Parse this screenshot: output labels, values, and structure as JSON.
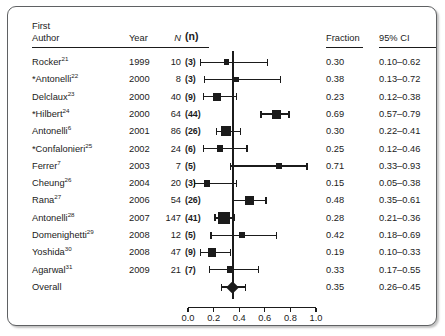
{
  "figure": {
    "type": "forest-plot",
    "headers": {
      "author_line1": "First",
      "author_line2": "Author",
      "year": "Year",
      "N": "N",
      "n": "(n)",
      "fraction": "Fraction",
      "ci": "95% CI"
    },
    "overall_label": "Overall"
  },
  "chart_data": {
    "type": "scatter",
    "title": "",
    "xlabel": "",
    "ylabel": "",
    "xlim": [
      0.0,
      1.0
    ],
    "xticks": [
      "0.0",
      "0.2",
      "0.4",
      "0.6",
      "0.8",
      "1.0"
    ],
    "xtick_values": [
      0.0,
      0.2,
      0.4,
      0.6,
      0.8,
      1.0
    ],
    "grid": false,
    "legend": "none",
    "reference_line": 0.35,
    "categories": [
      "Rocker 1999",
      "*Antonelli 2000",
      "Delclaux 2000",
      "*Hilbert 2000",
      "Antonelli 2001",
      "*Confalonieri 2002",
      "Ferrer 2003",
      "Cheung 2004",
      "Rana 2006",
      "Antonelli 2007",
      "Domenighetti 2008",
      "Yoshida 2008",
      "Agarwal 2009",
      "Overall"
    ],
    "values": [
      0.3,
      0.38,
      0.23,
      0.69,
      0.3,
      0.25,
      0.71,
      0.15,
      0.48,
      0.28,
      0.42,
      0.19,
      0.33,
      0.35
    ],
    "ci_low": [
      0.1,
      0.13,
      0.12,
      0.57,
      0.22,
      0.12,
      0.33,
      0.05,
      0.35,
      0.21,
      0.18,
      0.1,
      0.17,
      0.26
    ],
    "ci_high": [
      0.62,
      0.72,
      0.38,
      0.79,
      0.41,
      0.46,
      0.93,
      0.38,
      0.61,
      0.36,
      0.69,
      0.33,
      0.55,
      0.45
    ]
  },
  "rows": [
    {
      "author": "Rocker",
      "ref": "21",
      "star": "",
      "year": "1999",
      "N": "10",
      "n": "(3)",
      "fraction": "0.30",
      "ci": "0.10–0.62",
      "est": 0.3,
      "low": 0.1,
      "high": 0.62,
      "weight": 10
    },
    {
      "author": "Antonelli",
      "ref": "22",
      "star": "*",
      "year": "2000",
      "N": "8",
      "n": "(3)",
      "fraction": "0.38",
      "ci": "0.13–0.72",
      "est": 0.38,
      "low": 0.13,
      "high": 0.72,
      "weight": 8
    },
    {
      "author": "Delclaux",
      "ref": "23",
      "star": "",
      "year": "2000",
      "N": "40",
      "n": "(9)",
      "fraction": "0.23",
      "ci": "0.12–0.38",
      "est": 0.23,
      "low": 0.12,
      "high": 0.38,
      "weight": 40
    },
    {
      "author": "Hilbert",
      "ref": "24",
      "star": "*",
      "year": "2000",
      "N": "64",
      "n": "(44)",
      "fraction": "0.69",
      "ci": "0.57–0.79",
      "est": 0.69,
      "low": 0.57,
      "high": 0.79,
      "weight": 64
    },
    {
      "author": "Antonelli",
      "ref": "6",
      "star": "",
      "year": "2001",
      "N": "86",
      "n": "(26)",
      "fraction": "0.30",
      "ci": "0.22–0.41",
      "est": 0.3,
      "low": 0.22,
      "high": 0.41,
      "weight": 86
    },
    {
      "author": "Confalonieri",
      "ref": "25",
      "star": "*",
      "year": "2002",
      "N": "24",
      "n": "(6)",
      "fraction": "0.25",
      "ci": "0.12–0.46",
      "est": 0.25,
      "low": 0.12,
      "high": 0.46,
      "weight": 24
    },
    {
      "author": "Ferrer",
      "ref": "7",
      "star": "",
      "year": "2003",
      "N": "7",
      "n": "(5)",
      "fraction": "0.71",
      "ci": "0.33–0.93",
      "est": 0.71,
      "low": 0.33,
      "high": 0.93,
      "weight": 7
    },
    {
      "author": "Cheung",
      "ref": "26",
      "star": "",
      "year": "2004",
      "N": "20",
      "n": "(3)",
      "fraction": "0.15",
      "ci": "0.05–0.38",
      "est": 0.15,
      "low": 0.05,
      "high": 0.38,
      "weight": 20
    },
    {
      "author": "Rana",
      "ref": "27",
      "star": "",
      "year": "2006",
      "N": "54",
      "n": "(26)",
      "fraction": "0.48",
      "ci": "0.35–0.61",
      "est": 0.48,
      "low": 0.35,
      "high": 0.61,
      "weight": 54
    },
    {
      "author": "Antonelli",
      "ref": "28",
      "star": "",
      "year": "2007",
      "N": "147",
      "n": "(41)",
      "fraction": "0.28",
      "ci": "0.21–0.36",
      "est": 0.28,
      "low": 0.21,
      "high": 0.36,
      "weight": 147
    },
    {
      "author": "Domenighetti",
      "ref": "29",
      "star": "",
      "year": "2008",
      "N": "12",
      "n": "(5)",
      "fraction": "0.42",
      "ci": "0.18–0.69",
      "est": 0.42,
      "low": 0.18,
      "high": 0.69,
      "weight": 12
    },
    {
      "author": "Yoshida",
      "ref": "30",
      "star": "",
      "year": "2008",
      "N": "47",
      "n": "(9)",
      "fraction": "0.19",
      "ci": "0.10–0.33",
      "est": 0.19,
      "low": 0.1,
      "high": 0.33,
      "weight": 47
    },
    {
      "author": "Agarwal",
      "ref": "31",
      "star": "",
      "year": "2009",
      "N": "21",
      "n": "(7)",
      "fraction": "0.33",
      "ci": "0.17–0.55",
      "est": 0.33,
      "low": 0.17,
      "high": 0.55,
      "weight": 21
    }
  ],
  "overall": {
    "label": "Overall",
    "fraction": "0.35",
    "ci": "0.26–0.45",
    "est": 0.35,
    "low": 0.26,
    "high": 0.45
  }
}
